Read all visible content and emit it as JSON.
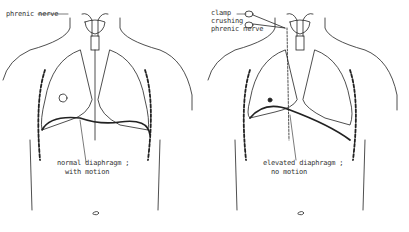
{
  "figure": {
    "panels": [
      {
        "id": "left",
        "labels": {
          "nerve": "phrenic nerve",
          "diaphragm_line1": "normal diaphragm ;",
          "diaphragm_line2": "with motion"
        }
      },
      {
        "id": "right",
        "labels": {
          "clamp_line1": "clamp",
          "clamp_line2": "crushing",
          "clamp_line3": "phrenic nerve",
          "diaphragm_line1": "elevated diaphragm ;",
          "diaphragm_line2": "no motion"
        }
      }
    ]
  }
}
